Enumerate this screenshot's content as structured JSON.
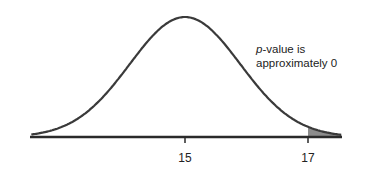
{
  "chart_data": {
    "type": "area",
    "title": "",
    "xlabel": "",
    "ylabel": "",
    "distribution": "normal",
    "mean": 15,
    "sd": 0.9,
    "xlim": [
      12.5,
      17.55
    ],
    "tick_labels": [
      "15",
      "17"
    ],
    "ticks": [
      15,
      17
    ],
    "shaded_region": {
      "from": 17,
      "to": 17.55,
      "side": "right-tail"
    },
    "annotation": {
      "italic_prefix": "p",
      "line1_rest": "-value is",
      "line2": "approximately 0"
    },
    "grid": false,
    "legend": "none"
  },
  "colors": {
    "curve": "#3a3a3a",
    "axis": "#2a2a2a",
    "shade": "#8c8c8c",
    "text": "#222222"
  }
}
